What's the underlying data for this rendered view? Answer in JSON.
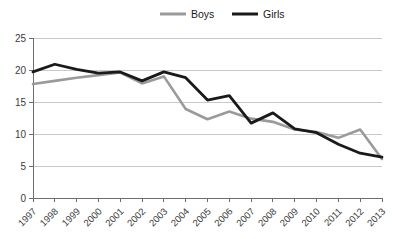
{
  "chart_data": {
    "type": "line",
    "title": "",
    "subtitle": "",
    "xlabel": "",
    "ylabel": "",
    "x": [
      "1997",
      "1998",
      "1999",
      "2000",
      "2001",
      "2002",
      "2003",
      "2004",
      "2005",
      "2006",
      "2007",
      "2008",
      "2009",
      "2010",
      "2011",
      "2012",
      "2013"
    ],
    "categories": [
      "1997",
      "1998",
      "1999",
      "2000",
      "2001",
      "2002",
      "2003",
      "2004",
      "2005",
      "2006",
      "2007",
      "2008",
      "2009",
      "2010",
      "2011",
      "2012",
      "2013"
    ],
    "series": [
      {
        "name": "Boys",
        "color": "#9a9a9a",
        "values": [
          17.8,
          18.3,
          18.8,
          19.2,
          19.6,
          17.9,
          19.0,
          13.9,
          12.3,
          13.5,
          12.4,
          11.9,
          10.7,
          10.3,
          9.4,
          10.7,
          6.1
        ]
      },
      {
        "name": "Girls",
        "color": "#1a1a1a",
        "values": [
          19.7,
          20.9,
          20.1,
          19.5,
          19.7,
          18.3,
          19.7,
          18.8,
          15.3,
          16.0,
          11.7,
          13.3,
          10.8,
          10.2,
          8.4,
          7.0,
          6.4
        ]
      }
    ],
    "ylim": [
      0,
      25
    ],
    "yticks": [
      0,
      5,
      10,
      15,
      20,
      25
    ],
    "ytick_labels": [
      "0",
      "5",
      "10",
      "15",
      "20",
      "25"
    ],
    "grid": true,
    "legend_position": "top-center"
  },
  "legend": {
    "entries": [
      {
        "label": "Boys",
        "color": "#9a9a9a"
      },
      {
        "label": "Girls",
        "color": "#1a1a1a"
      }
    ]
  },
  "axes": {
    "y_tick_labels": [
      "25",
      "20",
      "15",
      "10",
      "5",
      "0"
    ],
    "x_tick_labels": [
      "1997",
      "1998",
      "1999",
      "2000",
      "2001",
      "2002",
      "2003",
      "2004",
      "2005",
      "2006",
      "2007",
      "2008",
      "2009",
      "2010",
      "2011",
      "2012",
      "2013"
    ]
  },
  "colors": {
    "boys_line": "#9a9a9a",
    "girls_line": "#1a1a1a",
    "gridline": "#c9c9c9",
    "axis": "#6e6e6e",
    "background": "#ffffff"
  }
}
